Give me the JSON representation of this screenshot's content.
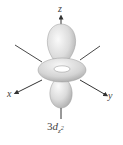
{
  "diagram": {
    "caption": {
      "prefix": "3",
      "italic": "d",
      "subscript": "z",
      "superscript": "2"
    },
    "axes": {
      "x": "x",
      "y": "y",
      "z": "z"
    },
    "colors": {
      "lobe_light": "#f2f2f2",
      "lobe_mid": "#d6d6d6",
      "lobe_dark": "#a8a8a8",
      "axis": "#333333",
      "label": "#444444"
    },
    "parts": [
      "upper lobe",
      "torus ring",
      "lower lobe"
    ]
  }
}
